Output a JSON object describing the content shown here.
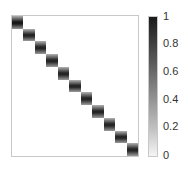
{
  "chart_data": {
    "type": "heatmap",
    "title": "",
    "xlabel": "",
    "ylabel": "",
    "grid": false,
    "matrix_size": 11,
    "diagonal_values": [
      0.9,
      0.85,
      0.85,
      0.85,
      0.85,
      0.85,
      0.85,
      0.85,
      0.85,
      0.85,
      0.85
    ],
    "off_diagonal_value": 0,
    "colorbar": {
      "position": "right",
      "colormap": "gray_r",
      "range": [
        0,
        1
      ],
      "ticks": [
        "0",
        "0.2",
        "0.4",
        "0.6",
        "0.8",
        "1"
      ]
    }
  },
  "colorbar_ticks": [
    {
      "label": "1",
      "top": 16
    },
    {
      "label": "0.8",
      "top": 43
    },
    {
      "label": "0.6",
      "top": 71
    },
    {
      "label": "0.4",
      "top": 99
    },
    {
      "label": "0.2",
      "top": 126
    },
    {
      "label": "0",
      "top": 152
    }
  ]
}
